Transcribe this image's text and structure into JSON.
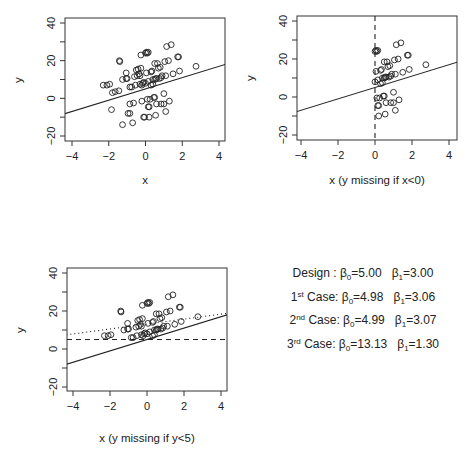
{
  "chart_data": [
    {
      "type": "scatter",
      "panel": "top-left",
      "title": "",
      "xlabel": "x",
      "ylabel": "y",
      "xlim": [
        -4.3,
        4.3
      ],
      "ylim": [
        -22,
        42
      ],
      "xticks": [
        "-4",
        "-2",
        "0",
        "2",
        "4"
      ],
      "yticks": [
        "-20",
        "0",
        "20",
        "40"
      ],
      "lines": [
        {
          "name": "Design fit",
          "style": "solid",
          "intercept": 5.0,
          "slope": 3.0
        }
      ],
      "points_subset": "all"
    },
    {
      "type": "scatter",
      "panel": "top-right",
      "title": "",
      "xlabel": "x (y missing if x<0)",
      "ylabel": "y",
      "xlim": [
        -4.3,
        4.3
      ],
      "ylim": [
        -22,
        42
      ],
      "xticks": [
        "-4",
        "-2",
        "0",
        "2",
        "4"
      ],
      "yticks": [
        "-20",
        "0",
        "20",
        "40"
      ],
      "lines": [
        {
          "name": "Design fit",
          "style": "solid",
          "intercept": 5.0,
          "slope": 3.0
        },
        {
          "name": "cutoff x=0",
          "style": "dashed",
          "vertical_x": 0
        }
      ],
      "points_subset": "x>=0"
    },
    {
      "type": "scatter",
      "panel": "bottom-left",
      "title": "",
      "xlabel": "x (y missing if y<5)",
      "ylabel": "y",
      "xlim": [
        -4.3,
        4.3
      ],
      "ylim": [
        -22,
        42
      ],
      "xticks": [
        "-4",
        "-2",
        "0",
        "2",
        "4"
      ],
      "yticks": [
        "-20",
        "0",
        "20",
        "40"
      ],
      "lines": [
        {
          "name": "Design fit",
          "style": "solid",
          "intercept": 5.0,
          "slope": 3.0
        },
        {
          "name": "cutoff y=5",
          "style": "dashed",
          "horizontal_y": 5
        },
        {
          "name": "3rd case fit",
          "style": "dotted",
          "intercept": 13.13,
          "slope": 1.3
        }
      ],
      "points_subset": "y>=5"
    }
  ],
  "points": [
    [
      -2.3,
      7
    ],
    [
      -2.1,
      7
    ],
    [
      -1.95,
      7.5
    ],
    [
      -1.8,
      3
    ],
    [
      -1.65,
      3.5
    ],
    [
      -1.45,
      4
    ],
    [
      -1.85,
      -6
    ],
    [
      -1.4,
      19.5
    ],
    [
      -1.42,
      20
    ],
    [
      -1.25,
      10
    ],
    [
      -1.05,
      13.5
    ],
    [
      -1.0,
      10.5
    ],
    [
      -1.05,
      10.5
    ],
    [
      -0.95,
      -8
    ],
    [
      -0.85,
      -8
    ],
    [
      -0.85,
      -3
    ],
    [
      -0.85,
      6
    ],
    [
      -0.75,
      6
    ],
    [
      -0.65,
      -2.5
    ],
    [
      -0.7,
      -13
    ],
    [
      -1.25,
      -14
    ],
    [
      -0.5,
      15
    ],
    [
      -0.45,
      12
    ],
    [
      -0.4,
      15.5
    ],
    [
      -0.35,
      13
    ],
    [
      -0.3,
      12
    ],
    [
      -0.3,
      7.5
    ],
    [
      -0.25,
      23
    ],
    [
      -0.25,
      16
    ],
    [
      -0.2,
      7
    ],
    [
      -0.2,
      -1.5
    ],
    [
      -0.15,
      8
    ],
    [
      -0.1,
      8.5
    ],
    [
      -0.1,
      -10
    ],
    [
      -0.05,
      -10
    ],
    [
      0.0,
      8
    ],
    [
      0.0,
      24
    ],
    [
      0.05,
      24.5
    ],
    [
      0.1,
      24
    ],
    [
      0.15,
      24.5
    ],
    [
      0.05,
      13.5
    ],
    [
      0.1,
      -0.5
    ],
    [
      0.15,
      9
    ],
    [
      0.15,
      -4.5
    ],
    [
      0.2,
      -4.5
    ],
    [
      0.2,
      -10
    ],
    [
      0.25,
      -0.5
    ],
    [
      0.3,
      14
    ],
    [
      0.35,
      14.5
    ],
    [
      0.4,
      10
    ],
    [
      0.45,
      0.5
    ],
    [
      0.5,
      0.5
    ],
    [
      0.5,
      10
    ],
    [
      0.55,
      10.5
    ],
    [
      0.5,
      18.5
    ],
    [
      0.55,
      -9
    ],
    [
      0.6,
      10.5
    ],
    [
      0.6,
      -3
    ],
    [
      0.65,
      18.5
    ],
    [
      0.7,
      16
    ],
    [
      0.75,
      10.5
    ],
    [
      0.8,
      16.5
    ],
    [
      0.85,
      11
    ],
    [
      0.85,
      -3
    ],
    [
      0.9,
      12
    ],
    [
      1.0,
      2.5
    ],
    [
      1.0,
      -3
    ],
    [
      1.05,
      19.5
    ],
    [
      1.1,
      12
    ],
    [
      1.1,
      -7
    ],
    [
      1.15,
      27.5
    ],
    [
      1.25,
      20
    ],
    [
      1.3,
      -1.5
    ],
    [
      1.4,
      28.5
    ],
    [
      1.5,
      13
    ],
    [
      1.75,
      22
    ],
    [
      1.8,
      22
    ],
    [
      1.85,
      14.5
    ],
    [
      2.75,
      17
    ],
    [
      0.3,
      7
    ],
    [
      0.4,
      7.5
    ],
    [
      -0.55,
      7
    ],
    [
      -0.6,
      11.5
    ]
  ],
  "legend": {
    "rows": [
      {
        "case": "Design",
        "sup": "",
        "sep": " : ",
        "b0_label": "β",
        "b0_sub": "0",
        "b0_value": "=5.00",
        "b1_label": "β",
        "b1_sub": "1",
        "b1_value": "=3.00"
      },
      {
        "case": "1",
        "sup": "st",
        "sep": " Case: ",
        "b0_label": "β",
        "b0_sub": "0",
        "b0_value": "=4.98",
        "b1_label": "β",
        "b1_sub": "1",
        "b1_value": "=3.06"
      },
      {
        "case": "2",
        "sup": "nd",
        "sep": " Case: ",
        "b0_label": "β",
        "b0_sub": "0",
        "b0_value": "=4.99",
        "b1_label": "β",
        "b1_sub": "1",
        "b1_value": "=3.07"
      },
      {
        "case": "3",
        "sup": "rd",
        "sep": " Case: ",
        "b0_label": "β",
        "b0_sub": "0",
        "b0_value": "=13.13",
        "b1_label": "β",
        "b1_sub": "1",
        "b1_value": "=1.30"
      }
    ]
  },
  "colors": {
    "ink": "#222222",
    "frame": "#333333",
    "background": "#ffffff"
  }
}
